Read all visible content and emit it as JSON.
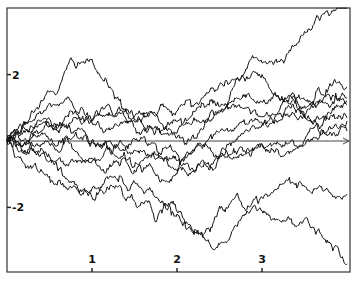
{
  "chart_data": {
    "type": "line",
    "title": "",
    "xlabel": "",
    "ylabel": "",
    "xlim": [
      0,
      4
    ],
    "ylim": [
      -4,
      4
    ],
    "x_ticks": [
      1,
      2,
      3
    ],
    "x_tick_labels": [
      "1",
      "2",
      "3"
    ],
    "y_ticks": [
      2,
      -2
    ],
    "y_tick_labels": [
      "2",
      "-2"
    ],
    "grid": false,
    "legend": null,
    "zero_axis": true,
    "series": [
      {
        "name": "path-1",
        "anchors": [
          [
            0,
            0
          ],
          [
            0.3,
            0.6
          ],
          [
            0.6,
            1.1
          ],
          [
            1.0,
            0.6
          ],
          [
            1.3,
            0.8
          ],
          [
            1.7,
            0.9
          ],
          [
            2.0,
            0.9
          ],
          [
            2.3,
            1.3
          ],
          [
            2.6,
            1.7
          ],
          [
            2.9,
            2.5
          ],
          [
            3.2,
            2.4
          ],
          [
            3.5,
            3.3
          ],
          [
            3.8,
            3.8
          ],
          [
            4.0,
            4.0
          ]
        ]
      },
      {
        "name": "path-2",
        "anchors": [
          [
            0,
            0
          ],
          [
            0.3,
            0.9
          ],
          [
            0.6,
            1.5
          ],
          [
            0.9,
            2.4
          ],
          [
            1.2,
            1.6
          ],
          [
            1.5,
            0.4
          ],
          [
            1.8,
            0.3
          ],
          [
            2.1,
            0.5
          ],
          [
            2.4,
            0.9
          ],
          [
            2.8,
            1.8
          ],
          [
            3.0,
            2.0
          ],
          [
            3.3,
            1.3
          ],
          [
            3.6,
            0.6
          ],
          [
            4.0,
            1.1
          ]
        ]
      },
      {
        "name": "path-3",
        "anchors": [
          [
            0,
            0
          ],
          [
            0.3,
            -0.8
          ],
          [
            0.6,
            -1.2
          ],
          [
            1.0,
            -1.7
          ],
          [
            1.4,
            -1.8
          ],
          [
            1.8,
            -2.1
          ],
          [
            2.1,
            -2.5
          ],
          [
            2.4,
            -3.2
          ],
          [
            2.6,
            -3.0
          ],
          [
            2.8,
            -2.2
          ],
          [
            3.0,
            -2.1
          ],
          [
            3.3,
            -2.3
          ],
          [
            3.6,
            -2.6
          ],
          [
            4.0,
            -3.7
          ]
        ]
      },
      {
        "name": "path-4",
        "anchors": [
          [
            0,
            0
          ],
          [
            0.3,
            -0.3
          ],
          [
            0.6,
            -0.9
          ],
          [
            0.9,
            -1.6
          ],
          [
            1.2,
            -1.1
          ],
          [
            1.6,
            -1.5
          ],
          [
            2.0,
            -2.2
          ],
          [
            2.3,
            -2.9
          ],
          [
            2.7,
            -1.6
          ],
          [
            3.0,
            -1.7
          ],
          [
            3.3,
            -1.2
          ],
          [
            3.6,
            -1.5
          ],
          [
            4.0,
            -1.6
          ]
        ]
      },
      {
        "name": "path-5",
        "anchors": [
          [
            0,
            0
          ],
          [
            0.4,
            0.6
          ],
          [
            0.8,
            0.3
          ],
          [
            1.2,
            -0.2
          ],
          [
            1.6,
            -0.6
          ],
          [
            2.0,
            -0.4
          ],
          [
            2.4,
            0.2
          ],
          [
            2.8,
            0.5
          ],
          [
            3.2,
            0.9
          ],
          [
            3.6,
            1.2
          ],
          [
            4.0,
            1.3
          ]
        ]
      },
      {
        "name": "path-6",
        "anchors": [
          [
            0,
            0
          ],
          [
            0.4,
            -0.4
          ],
          [
            0.8,
            -0.6
          ],
          [
            1.2,
            -0.2
          ],
          [
            1.6,
            0.1
          ],
          [
            2.0,
            -0.6
          ],
          [
            2.4,
            -0.3
          ],
          [
            2.8,
            0.3
          ],
          [
            3.2,
            0.6
          ],
          [
            3.6,
            0.5
          ],
          [
            4.0,
            0.7
          ]
        ]
      },
      {
        "name": "path-7",
        "anchors": [
          [
            0,
            0
          ],
          [
            0.4,
            0.3
          ],
          [
            0.8,
            0.7
          ],
          [
            1.2,
            0.4
          ],
          [
            1.6,
            0.5
          ],
          [
            2.0,
            0.1
          ],
          [
            2.4,
            0.6
          ],
          [
            2.8,
            1.0
          ],
          [
            3.2,
            0.8
          ],
          [
            3.6,
            1.1
          ],
          [
            4.0,
            1.2
          ]
        ]
      },
      {
        "name": "path-8",
        "anchors": [
          [
            0,
            0
          ],
          [
            0.4,
            -0.1
          ],
          [
            0.8,
            0.2
          ],
          [
            1.2,
            0.0
          ],
          [
            1.6,
            -0.3
          ],
          [
            2.0,
            -0.9
          ],
          [
            2.4,
            -0.8
          ],
          [
            2.8,
            -0.3
          ],
          [
            3.2,
            -0.4
          ],
          [
            3.6,
            0.1
          ],
          [
            4.0,
            0.3
          ]
        ]
      },
      {
        "name": "path-9",
        "anchors": [
          [
            0,
            0
          ],
          [
            0.4,
            0.2
          ],
          [
            0.8,
            -0.3
          ],
          [
            1.2,
            -0.8
          ],
          [
            1.6,
            -0.9
          ],
          [
            2.0,
            -1.0
          ],
          [
            2.4,
            -0.7
          ],
          [
            2.8,
            -0.4
          ],
          [
            3.2,
            -0.1
          ],
          [
            3.6,
            0.4
          ],
          [
            4.0,
            0.6
          ]
        ]
      },
      {
        "name": "path-10",
        "anchors": [
          [
            0,
            0
          ],
          [
            0.4,
            0.5
          ],
          [
            0.8,
            0.9
          ],
          [
            1.2,
            1.1
          ],
          [
            1.6,
            0.7
          ],
          [
            2.0,
            0.6
          ],
          [
            2.4,
            1.2
          ],
          [
            2.8,
            1.4
          ],
          [
            3.2,
            1.3
          ],
          [
            3.6,
            1.0
          ],
          [
            4.0,
            1.6
          ]
        ]
      }
    ]
  }
}
